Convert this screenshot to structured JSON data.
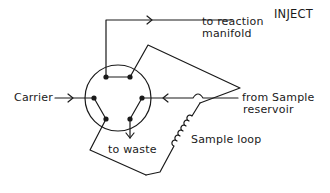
{
  "diagram": {
    "title": "INJECT",
    "labels": {
      "carrier": "Carrier",
      "to_reaction_line1": "to reaction",
      "to_reaction_line2": "manifold",
      "from_sample_line1": "from Sample",
      "from_sample_line2": "reservoir",
      "sample_loop": "Sample loop",
      "to_waste": "to waste"
    },
    "components": {
      "valve": "six-port rotary injection valve",
      "ports": 6,
      "loop": "sample loop (coiled)"
    },
    "colors": {
      "line": "#1a1a1a",
      "background": "#ffffff"
    }
  }
}
